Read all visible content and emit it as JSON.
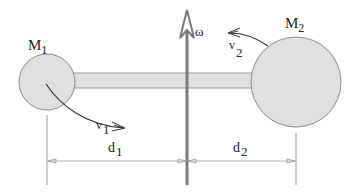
{
  "diagram": {
    "type": "rotating-dumbbell",
    "axis_label": "ω",
    "masses": [
      {
        "name": "M",
        "sub": "1",
        "cx": 47,
        "cy": 82,
        "r": 28
      },
      {
        "name": "M",
        "sub": "2",
        "cx": 296,
        "cy": 82,
        "r": 45
      }
    ],
    "velocities": [
      {
        "name": "v",
        "sub": "1"
      },
      {
        "name": "v",
        "sub": "2"
      }
    ],
    "distances": [
      {
        "name": "d",
        "sub": "1"
      },
      {
        "name": "d",
        "sub": "2"
      }
    ],
    "colors": {
      "fill": "#e0e0e0",
      "stroke": "#888888",
      "axis": "#7a7a7a",
      "line": "#333333",
      "dim": "#999999"
    }
  }
}
